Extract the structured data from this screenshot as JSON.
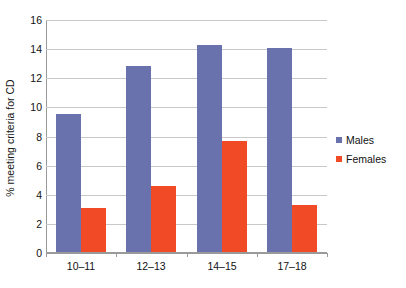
{
  "chart_data": {
    "type": "bar",
    "title": "",
    "subtitle": "",
    "xlabel": "",
    "ylabel": "% meeting criteria for CD",
    "categories": [
      "10–11",
      "12–13",
      "14–15",
      "17–18"
    ],
    "series": [
      {
        "name": "Males",
        "color": "#6a72ad",
        "values": [
          9.5,
          12.8,
          14.2,
          14.0
        ]
      },
      {
        "name": "Females",
        "color": "#f04a26",
        "values": [
          3.0,
          4.5,
          7.6,
          3.2
        ]
      }
    ],
    "ylim": [
      0,
      16
    ],
    "ytick_values": [
      0,
      2,
      4,
      6,
      8,
      10,
      12,
      14,
      16
    ],
    "ytick_labels": [
      "0",
      "2",
      "4",
      "6",
      "8",
      "10",
      "12",
      "14",
      "16"
    ],
    "grid": true,
    "grid_axis": "y",
    "legend_position": "right",
    "legend": [
      {
        "label": "Males",
        "color": "#6a72ad"
      },
      {
        "label": "Females",
        "color": "#f04a26"
      }
    ]
  },
  "colors": {
    "males": "#6a72ad",
    "females": "#f04a26",
    "grid": "#c8c8c8",
    "axis": "#9a9a9a",
    "text": "#111111",
    "background": "#ffffff"
  }
}
